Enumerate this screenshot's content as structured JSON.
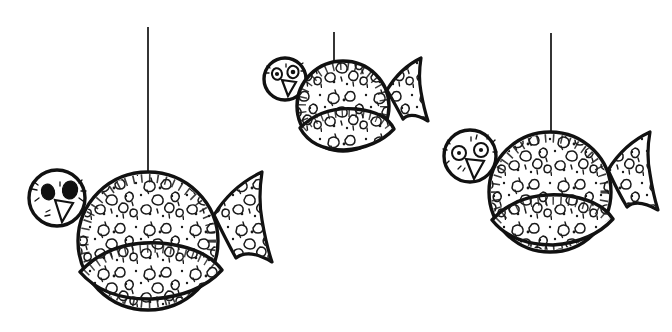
{
  "artwork": {
    "title": "Three hanging speckled bird ornaments",
    "medium": "black ink line drawing",
    "background_color": "#ffffff",
    "ink_color": "#111111",
    "canvas": {
      "width": 672,
      "height": 332
    },
    "subject_count": 3,
    "alt_text": "Hand drawn black ink illustration of three round speckled bird ornaments hanging from thin vertical threads, each with a circular head, triangular beak, leaf shaped wing and fan shaped tail."
  },
  "birds": [
    {
      "id": "bird-left",
      "label": "large bird lower left",
      "size": "large",
      "thread": {
        "x": 148,
        "y_top": 27,
        "y_bottom": 175
      },
      "body": {
        "cx": 148,
        "cy": 241,
        "rx": 70,
        "ry": 69
      },
      "head": {
        "cx": 57,
        "cy": 198,
        "r": 28
      },
      "eye_style": "filled",
      "eyes": [
        {
          "cx": 48,
          "cy": 192,
          "rx": 6.5,
          "ry": 8.0,
          "rot": -14
        },
        {
          "cx": 70,
          "cy": 190,
          "rx": 7.5,
          "ry": 9.0,
          "rot": 10
        }
      ],
      "beak": {
        "points": "55,200 73,203 62,222"
      },
      "wing": {
        "cx": 152,
        "cy": 268,
        "rx": 72,
        "ry": 30,
        "rot": -4
      },
      "tail": {
        "anchor_x": 214,
        "anchor_y": 215
      }
    },
    {
      "id": "bird-middle",
      "label": "small bird upper middle",
      "size": "small",
      "thread": {
        "x": 334,
        "y_top": 32,
        "y_bottom": 68
      },
      "body": {
        "cx": 343,
        "cy": 106,
        "rx": 46,
        "ry": 45
      },
      "head": {
        "cx": 285,
        "cy": 79,
        "r": 21
      },
      "eye_style": "outline-pupil",
      "eyes": [
        {
          "cx": 277,
          "cy": 74,
          "rx": 5.0,
          "ry": 5.8,
          "rot": -12
        },
        {
          "cx": 293,
          "cy": 72,
          "rx": 5.6,
          "ry": 6.2,
          "rot": 10
        }
      ],
      "beak": {
        "points": "282,80 296,82 288,96"
      },
      "wing": {
        "cx": 346,
        "cy": 124,
        "rx": 48,
        "ry": 21,
        "rot": -6
      },
      "tail": {
        "anchor_x": 387,
        "anchor_y": 90
      }
    },
    {
      "id": "bird-right",
      "label": "medium bird lower right",
      "size": "medium",
      "thread": {
        "x": 551,
        "y_top": 33,
        "y_bottom": 132
      },
      "body": {
        "cx": 550,
        "cy": 192,
        "rx": 61,
        "ry": 60
      },
      "head": {
        "cx": 470,
        "cy": 156,
        "r": 26
      },
      "eye_style": "ring-dot",
      "eyes": [
        {
          "cx": 459,
          "cy": 153,
          "rx": 7.0,
          "ry": 7.0,
          "rot": 0
        },
        {
          "cx": 481,
          "cy": 150,
          "rx": 7.0,
          "ry": 7.0,
          "rot": 0
        }
      ],
      "beak": {
        "points": "466,159 484,161 474,179"
      },
      "wing": {
        "cx": 553,
        "cy": 216,
        "rx": 63,
        "ry": 27,
        "rot": -5
      },
      "tail": {
        "anchor_x": 608,
        "anchor_y": 170
      }
    }
  ],
  "texture": {
    "name": "hand-drawn speckle",
    "elements": [
      "irregular blobs",
      "triangles",
      "dots",
      "tick marks"
    ],
    "description": "Bodies, wings and tails are filled with small irregular closed shapes, dots and short tick strokes suggesting a mottled or crackled surface."
  }
}
